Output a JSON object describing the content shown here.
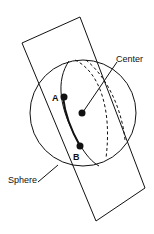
{
  "diagram": {
    "type": "geometry",
    "labels": {
      "center": "Center",
      "point_a": "A",
      "point_b": "B",
      "sphere": "Sphere"
    },
    "colors": {
      "stroke": "#111111",
      "background": "#ffffff"
    }
  }
}
